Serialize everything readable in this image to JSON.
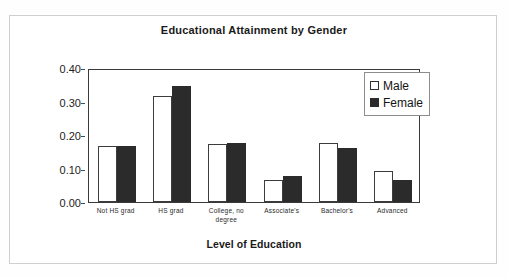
{
  "chart_data": {
    "type": "bar",
    "title": "Educational Attainment by Gender",
    "xlabel": "Level of Education",
    "ylabel": "Relative Frequency",
    "categories": [
      "Not HS grad",
      "HS grad",
      "College, no degree",
      "Associate's",
      "Bachelor's",
      "Advanced"
    ],
    "series": [
      {
        "name": "Male",
        "values": [
          0.166,
          0.316,
          0.172,
          0.067,
          0.177,
          0.092
        ],
        "color": "#ffffff",
        "edge_color": "#3c3c3c"
      },
      {
        "name": "Female",
        "values": [
          0.166,
          0.346,
          0.175,
          0.077,
          0.161,
          0.067
        ],
        "color": "#2b2b2b",
        "edge_color": "#2b2b2b"
      }
    ],
    "ylim": [
      0.0,
      0.4
    ],
    "ytick_labels": [
      "0.00",
      "0.10",
      "0.20",
      "0.30",
      "0.40"
    ],
    "ytick_values": [
      0.0,
      0.1,
      0.2,
      0.3,
      0.4
    ],
    "grid": false,
    "legend_position": "top-right",
    "legend_entries": [
      "Male",
      "Female"
    ]
  },
  "legend": {
    "male_label": "Male",
    "female_label": "Female"
  },
  "axis": {
    "y_title": "Relative Frequency",
    "x_title": "Level of Education"
  }
}
